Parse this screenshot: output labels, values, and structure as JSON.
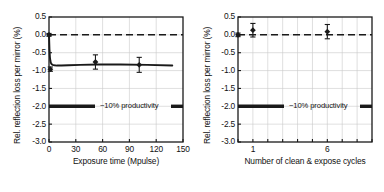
{
  "figure": {
    "background": "#ffffff",
    "line_color": "#1a1a1a",
    "grid_color": "#c9c9c9"
  },
  "chart_data": [
    {
      "type": "line",
      "panel": "left",
      "title": "",
      "xlabel": "Exposure time (Mpulse)",
      "ylabel": "Rel. reflection loss per mirror (%)",
      "xlim": [
        0,
        150
      ],
      "ylim": [
        -3.0,
        0.5
      ],
      "xticks": [
        0,
        30,
        60,
        90,
        120,
        150
      ],
      "xticklabels": [
        "0",
        "30",
        "60",
        "90",
        "120",
        "150"
      ],
      "yticks": [
        0.5,
        0.0,
        -0.5,
        -1.0,
        -1.5,
        -2.0,
        -2.5,
        -3.0
      ],
      "yticklabels": [
        "0.5",
        "0.0",
        "-0.5",
        "-1.0",
        "-1.5",
        "-2.0",
        "-2.5",
        "-3.0"
      ],
      "grid": true,
      "legend": "none",
      "reference_line": {
        "y": 0.0,
        "style": "dashed",
        "label": ""
      },
      "productivity_line": {
        "y": -2.0,
        "label": "−10% productivity"
      },
      "series": [
        {
          "name": "Rel. reflection loss vs exposure",
          "style": "solid-curve",
          "x": [
            0.0,
            0.5,
            1.0,
            1.5,
            2.0,
            3.0,
            4.0,
            6.0,
            9.0,
            14.0,
            22.0,
            35.0,
            55.0,
            80.0,
            110.0,
            138.0
          ],
          "y": [
            0.0,
            -0.4,
            -0.62,
            -0.72,
            -0.78,
            -0.82,
            -0.84,
            -0.85,
            -0.86,
            -0.86,
            -0.85,
            -0.84,
            -0.83,
            -0.83,
            -0.84,
            -0.86
          ]
        }
      ],
      "points": [
        {
          "x": 0.0,
          "y": 0.0,
          "yerr": 0.04
        },
        {
          "x": 1.5,
          "y": -0.96,
          "yerr": 0.06
        },
        {
          "x": 52.0,
          "y": -0.76,
          "yerr": 0.2
        },
        {
          "x": 101.0,
          "y": -0.84,
          "yerr": 0.21
        }
      ]
    },
    {
      "type": "scatter",
      "panel": "right",
      "title": "",
      "xlabel": "Number of clean & expose cycles",
      "ylabel": "Rel. reflection loss per mirror (%)",
      "xlim": [
        0,
        9
      ],
      "ylim": [
        -3.0,
        0.5
      ],
      "xticks": [
        1,
        6
      ],
      "xticklabels": [
        "1",
        "6"
      ],
      "yticks": [
        0.5,
        0.0,
        -0.5,
        -1.0,
        -1.5,
        -2.0,
        -2.5,
        -3.0
      ],
      "yticklabels": [
        "0.5",
        "0.0",
        "-0.5",
        "-1.0",
        "-1.5",
        "-2.0",
        "-2.5",
        "-3.0"
      ],
      "grid": true,
      "legend": "none",
      "reference_line": {
        "y": 0.0,
        "style": "dashed",
        "label": ""
      },
      "productivity_line": {
        "y": -2.0,
        "label": "−10% productivity"
      },
      "points": [
        {
          "x": 0.0,
          "y": 0.0,
          "yerr": 0.05
        },
        {
          "x": 1.0,
          "y": 0.13,
          "yerr": 0.19
        },
        {
          "x": 6.0,
          "y": 0.09,
          "yerr": 0.2
        }
      ]
    }
  ]
}
